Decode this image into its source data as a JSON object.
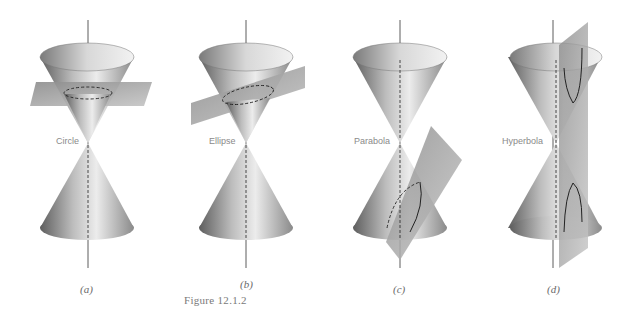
{
  "figure": {
    "caption": "Figure 12.1.2",
    "panels": [
      {
        "id": "a",
        "label": "Circle",
        "sublabel": "(a)"
      },
      {
        "id": "b",
        "label": "Ellipse",
        "sublabel": "(b)"
      },
      {
        "id": "c",
        "label": "Parabola",
        "sublabel": "(c)"
      },
      {
        "id": "d",
        "label": "Hyperbola",
        "sublabel": "(d)"
      }
    ]
  },
  "colors": {
    "background": "#ffffff",
    "cone_dark": "#6e6e6e",
    "cone_light": "#e8e8e8",
    "plane": "#9a9a9a",
    "axis": "#333333"
  }
}
